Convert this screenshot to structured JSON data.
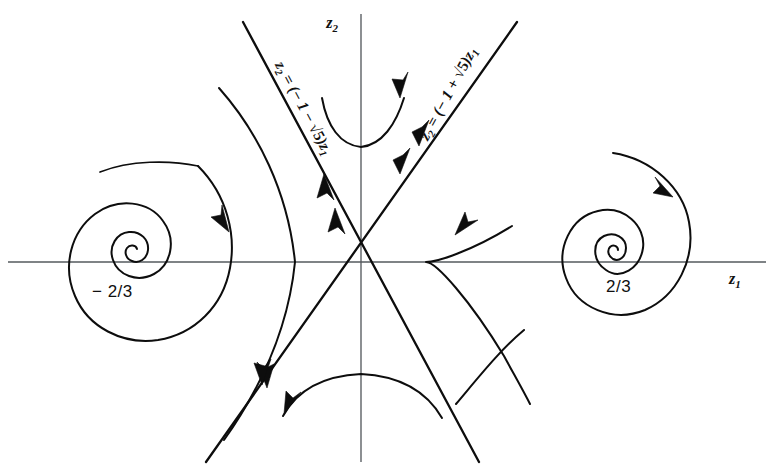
{
  "figure": {
    "kind": "phase-portrait",
    "background_color": "#ffffff",
    "curve_color": "#0d0d0d",
    "axis_color": "#555a5e"
  },
  "axes": {
    "horizontal": {
      "name": "z1",
      "label_main": "z",
      "label_sub": "1",
      "x": 735,
      "y": 278
    },
    "vertical": {
      "name": "z2",
      "label_main": "z",
      "label_sub": "2",
      "x": 338,
      "y": 28
    }
  },
  "fixed_points": [
    {
      "id": "spiral-left",
      "label": "− 2/3",
      "value": -0.6667,
      "type": "stable-spiral",
      "cx": 120,
      "cy": 262,
      "label_x": 92,
      "label_y": 296
    },
    {
      "id": "saddle-origin",
      "label": "",
      "value": 0,
      "type": "saddle",
      "cx": 361,
      "cy": 258
    },
    {
      "id": "spiral-right",
      "label": "2/3",
      "value": 0.6667,
      "type": "stable-spiral",
      "cx": 624,
      "cy": 258,
      "label_x": 610,
      "label_y": 292
    }
  ],
  "separatrices": [
    {
      "id": "separatrix-negative-slope",
      "equation_parts": {
        "lhs_main": "z",
        "lhs_sub": "2",
        "eq": " = (− 1 − ",
        "radical": "√5",
        "close": ")z",
        "rhs_sub": "1"
      },
      "equation_plain": "z2 = (−1 − √5)z1",
      "slope_sign": "negative",
      "label_x": 268,
      "label_y": 30,
      "rotation": 62
    },
    {
      "id": "separatrix-positive-slope",
      "equation_parts": {
        "lhs_main": "z",
        "lhs_sub": "2",
        "eq": " = (− 1 + ",
        "radical": "√5",
        "close": ")z",
        "rhs_sub": "1"
      },
      "equation_plain": "z2 = (−1 + √5)z1",
      "slope_sign": "positive",
      "label_x": 416,
      "label_y": 168,
      "rotation": -62
    }
  ],
  "trajectories": [
    {
      "id": "traj-upper-left-outer",
      "region": "left-of-saddle",
      "flow": "inward-to-left-spiral"
    },
    {
      "id": "traj-left-hyperbola",
      "region": "left-of-saddle",
      "flow": "away-from-saddle"
    },
    {
      "id": "traj-top-center",
      "region": "above-saddle",
      "flow": "up-and-right"
    },
    {
      "id": "traj-bottom-center",
      "region": "below-saddle",
      "flow": "down-and-left"
    },
    {
      "id": "traj-right-hyperbola",
      "region": "right-of-saddle",
      "flow": "away-from-saddle"
    },
    {
      "id": "traj-upper-right-outer",
      "region": "right-of-saddle",
      "flow": "inward-to-right-spiral"
    },
    {
      "id": "traj-lower-right-outer",
      "region": "right-of-saddle",
      "flow": "outward"
    }
  ],
  "arrow_count": 12
}
